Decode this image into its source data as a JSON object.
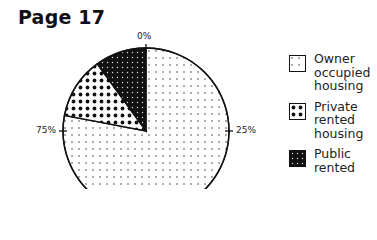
{
  "page": {
    "title": "Page 17"
  },
  "chart_data": {
    "type": "pie",
    "title": "",
    "start_angle": "top (0%), clockwise",
    "tick_labels": [
      "0%",
      "25%",
      "75%"
    ],
    "categories": [
      "Owner occupied housing",
      "Private rented housing",
      "Public rented housing"
    ],
    "values": [
      78,
      12,
      10
    ],
    "unit": "%",
    "legend_position": "right",
    "patterns": [
      "sparse dots",
      "large dots",
      "dense black with white dots"
    ]
  },
  "legend": {
    "items": [
      {
        "label": "Owner\noccupied\nhousing"
      },
      {
        "label": "Private\nrented\nhousing"
      },
      {
        "label": "Public\nrented"
      }
    ]
  },
  "ticks": {
    "top": "0%",
    "right": "25%",
    "left": "75%"
  }
}
